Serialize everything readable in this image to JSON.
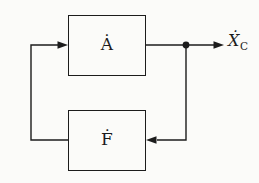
{
  "diagram": {
    "type": "feedback-block-diagram",
    "background_color": "#fbfbf9",
    "line_color": "#1c1c1c",
    "blocks": [
      {
        "id": "forward-block",
        "label": "Ȧ"
      },
      {
        "id": "feedback-block",
        "label": "Ḟ"
      }
    ],
    "output_label": {
      "base": "Ẋ",
      "subscript": "C"
    },
    "connections": [
      "feedback-block output → left → up → arrow into forward-block input",
      "forward-block output → pickoff dot → arrow to output label Ẋ_C",
      "pickoff dot → down → left → arrow into feedback-block input"
    ]
  }
}
